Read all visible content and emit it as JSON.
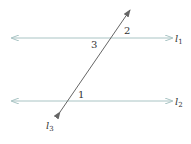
{
  "diagram": {
    "type": "parallel-lines-transversal",
    "lines": [
      {
        "id": "l1",
        "label": "l",
        "subscript": "1",
        "color": "#a9c4c4"
      },
      {
        "id": "l2",
        "label": "l",
        "subscript": "2",
        "color": "#a9c4c4"
      },
      {
        "id": "l3",
        "label": "l",
        "subscript": "3",
        "color": "#555555"
      }
    ],
    "angles": [
      {
        "id": "angle-1",
        "label": "1"
      },
      {
        "id": "angle-2",
        "label": "2"
      },
      {
        "id": "angle-3",
        "label": "3"
      }
    ]
  }
}
